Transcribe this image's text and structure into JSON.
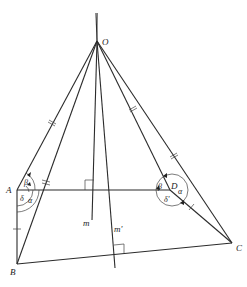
{
  "diagram": {
    "type": "geometry-figure",
    "points": {
      "O": {
        "label": "O",
        "x": 97,
        "y": 41
      },
      "A": {
        "label": "A",
        "x": 17,
        "y": 190
      },
      "B": {
        "label": "B",
        "x": 17,
        "y": 264
      },
      "C": {
        "label": "C",
        "x": 232,
        "y": 243
      },
      "D": {
        "label": "D",
        "x": 170,
        "y": 190
      }
    },
    "lines": {
      "m": {
        "label": "m"
      },
      "m_prime": {
        "label": "m'"
      }
    },
    "angles": {
      "A_beta": "β",
      "A_delta": "δ",
      "A_alpha": "α",
      "D_beta": "β",
      "D_alpha": "α",
      "D_delta_prime": "δ'"
    },
    "tick_marks": {
      "OA": "double",
      "OB": "double",
      "OD": "double",
      "OC": "double",
      "AB": "single",
      "DC": "single"
    },
    "right_angle_markers": [
      "m ⟂ AD",
      "m' ⟂ BC"
    ]
  }
}
